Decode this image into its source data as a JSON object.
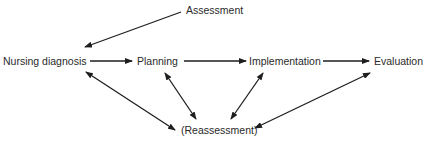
{
  "diagram": {
    "type": "nursing-process-flow",
    "nodes": {
      "assessment": "Assessment",
      "nursing_diagnosis": "Nursing diagnosis",
      "planning": "Planning",
      "implementation": "Implementation",
      "evaluation": "Evaluation",
      "reassessment": "(Reassessment)"
    },
    "edges": [
      {
        "from": "Assessment",
        "to": "Nursing diagnosis",
        "direction": "one-way"
      },
      {
        "from": "Nursing diagnosis",
        "to": "Planning",
        "direction": "one-way"
      },
      {
        "from": "Planning",
        "to": "Implementation",
        "direction": "one-way"
      },
      {
        "from": "Implementation",
        "to": "Evaluation",
        "direction": "one-way"
      },
      {
        "from": "Nursing diagnosis",
        "to": "(Reassessment)",
        "direction": "two-way"
      },
      {
        "from": "Planning",
        "to": "(Reassessment)",
        "direction": "two-way"
      },
      {
        "from": "Implementation",
        "to": "(Reassessment)",
        "direction": "two-way"
      },
      {
        "from": "Evaluation",
        "to": "(Reassessment)",
        "direction": "two-way"
      }
    ],
    "colors": {
      "line": "#1e1e1e",
      "text": "#2a2a2a",
      "background": "#ffffff"
    }
  }
}
